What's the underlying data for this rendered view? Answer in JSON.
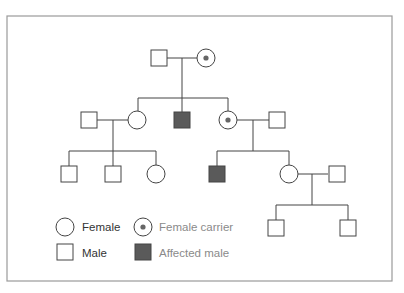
{
  "diagram": {
    "type": "pedigree chart",
    "colors": {
      "frame": "#9a9a9a",
      "line": "#444444",
      "affected_fill": "#5a5a5a",
      "carrier_dot": "#666666",
      "legend_dark_text": "#333333",
      "legend_light_text": "#8a8a8a"
    },
    "generations": [
      {
        "level": "I",
        "individuals": [
          "male",
          "female carrier"
        ]
      },
      {
        "level": "II",
        "individuals": [
          "male (spouse)",
          "female",
          "affected male",
          "female carrier",
          "male (spouse)"
        ]
      },
      {
        "level": "III",
        "individuals": [
          "male",
          "male",
          "female",
          "affected male",
          "female",
          "male (spouse)"
        ]
      },
      {
        "level": "IV",
        "individuals": [
          "male",
          "male"
        ]
      }
    ]
  },
  "legend": {
    "female": "Female",
    "female_carrier": "Female carrier",
    "male": "Male",
    "affected_male": "Affected male"
  }
}
